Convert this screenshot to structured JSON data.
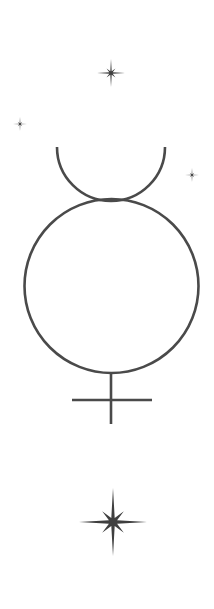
{
  "figure": {
    "title": "Mercury symbol with stars",
    "stroke_color": "#4a4a4a",
    "star_color": "#3f3f3f",
    "background": "#ffffff"
  },
  "symbol": {
    "name": "mercury-glyph",
    "crescent": {
      "cx": 111,
      "cy": 147,
      "r": 54
    },
    "circle": {
      "cx": 111.5,
      "cy": 286,
      "r": 87
    },
    "stem": {
      "x": 111,
      "y1": 373,
      "y2": 424
    },
    "crossbar": {
      "x1": 72,
      "x2": 152,
      "y": 400
    }
  },
  "stars": [
    {
      "name": "star-top",
      "cx": 111,
      "cy": 73,
      "size": 14
    },
    {
      "name": "star-left",
      "cx": 20,
      "cy": 124,
      "size": 7
    },
    {
      "name": "star-right",
      "cx": 192,
      "cy": 175,
      "size": 7
    },
    {
      "name": "star-bottom",
      "cx": 113,
      "cy": 522,
      "size": 34
    }
  ]
}
